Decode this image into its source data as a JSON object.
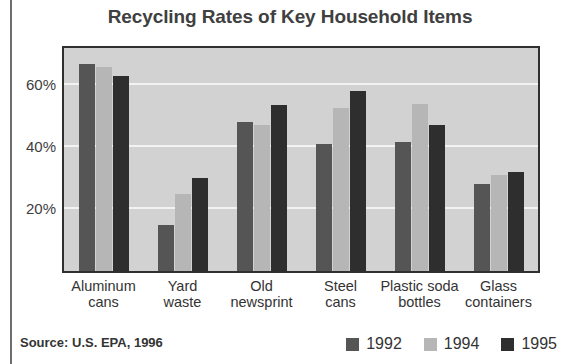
{
  "figure": {
    "title": "Recycling Rates of Key Household Items",
    "source_note": "Source: U.S. EPA, 1996"
  },
  "colors": {
    "series_1992": "#555555",
    "series_1994": "#b6b6b6",
    "series_1995": "#2e2e2e",
    "plot_background": "#d2d2d2",
    "plot_border": "#2f2f2f",
    "gridline": "#f2f2f2",
    "text": "#333333"
  },
  "legend": {
    "position": "bottom-right",
    "items": [
      {
        "label": "1992",
        "color": "#555555"
      },
      {
        "label": "1994",
        "color": "#b6b6b6"
      },
      {
        "label": "1995",
        "color": "#2e2e2e"
      }
    ]
  },
  "axis": {
    "y_ticks": [
      "20%",
      "40%",
      "60%"
    ],
    "x_labels": [
      {
        "line1": "Aluminum",
        "line2": "cans"
      },
      {
        "line1": "Yard",
        "line2": "waste"
      },
      {
        "line1": "Old",
        "line2": "newsprint"
      },
      {
        "line1": "Steel",
        "line2": "cans"
      },
      {
        "line1": "Plastic soda",
        "line2": "bottles"
      },
      {
        "line1": "Glass",
        "line2": "containers"
      }
    ]
  },
  "chart_data": {
    "type": "bar",
    "title": "Recycling Rates of Key Household Items",
    "xlabel": "",
    "ylabel": "",
    "ylim": [
      0,
      72
    ],
    "ytick_values": [
      20,
      40,
      60
    ],
    "ytick_labels": [
      "20%",
      "40%",
      "60%"
    ],
    "grid": true,
    "legend_position": "bottom-right",
    "source": "Source: U.S. EPA, 1996",
    "categories": [
      "Aluminum cans",
      "Yard waste",
      "Old newsprint",
      "Steel cans",
      "Plastic soda bottles",
      "Glass containers"
    ],
    "series": [
      {
        "name": "1992",
        "color": "#555555",
        "values": [
          67,
          15,
          48,
          41,
          41.5,
          28
        ]
      },
      {
        "name": "1994",
        "color": "#b6b6b6",
        "values": [
          66,
          25,
          47,
          52.5,
          54,
          31
        ]
      },
      {
        "name": "1995",
        "color": "#2e2e2e",
        "values": [
          63,
          30,
          53.5,
          58,
          47,
          32
        ]
      }
    ]
  }
}
